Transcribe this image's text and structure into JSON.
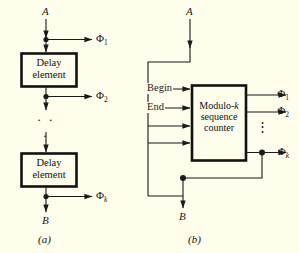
{
  "figure": {
    "background_color": "#fffdec",
    "line_color": "#1a1a1a",
    "panel_a": {
      "caption": "(a)",
      "input_label": "A",
      "output_label": "B",
      "blocks": [
        {
          "line1": "Delay",
          "line2": "element"
        },
        {
          "line1": "Delay",
          "line2": "element"
        }
      ],
      "vertical_ellipsis": "· · ·",
      "taps": [
        {
          "symbol": "Φ",
          "subscript": "1"
        },
        {
          "symbol": "Φ",
          "subscript": "2"
        },
        {
          "symbol": "Φ",
          "subscript": "k"
        }
      ]
    },
    "panel_b": {
      "caption": "(b)",
      "input_label": "A",
      "output_label": "B",
      "block": {
        "line1": "Modulo-",
        "line1_italic": "k",
        "line2": "sequence",
        "line3": "counter"
      },
      "control_inputs": [
        {
          "label": "Begin"
        },
        {
          "label": "End"
        },
        {
          "label": ""
        },
        {
          "label": ""
        }
      ],
      "outputs": [
        {
          "symbol": "Φ",
          "subscript": "1"
        },
        {
          "symbol": "Φ",
          "subscript": "2"
        },
        {
          "symbol": "Φ",
          "subscript": "k"
        }
      ],
      "output_ellipsis": "⋮"
    }
  }
}
